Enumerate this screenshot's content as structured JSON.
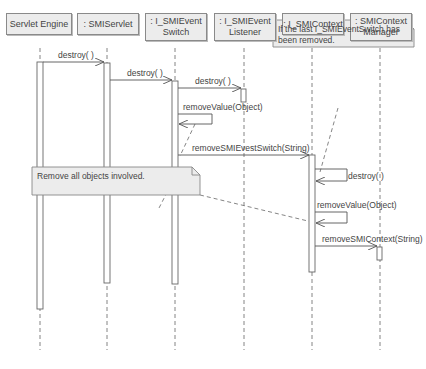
{
  "objects": [
    {
      "label": "Servlet Engine"
    },
    {
      "label": ": SMIServlet"
    },
    {
      "label": ": I_SMIEvent Switch"
    },
    {
      "label": ": I_SMIEvent Listener"
    },
    {
      "label": ": I_SMIContext"
    },
    {
      "label": ": SMIContext Manager"
    }
  ],
  "messages": [
    {
      "label": "destroy( )"
    },
    {
      "label": "destroy( )"
    },
    {
      "label": "destroy( )"
    },
    {
      "label": "removeValue(Object)"
    },
    {
      "label": "removeSMIEvestSwitch(String)"
    },
    {
      "label": "destroy( )"
    },
    {
      "label": "removeValue(Object)"
    },
    {
      "label": "removeSMIContext(String)"
    }
  ],
  "notes": [
    {
      "text": "If the last I_SMIEventSwitch has been removed."
    },
    {
      "text": "Remove all objects involved."
    }
  ]
}
